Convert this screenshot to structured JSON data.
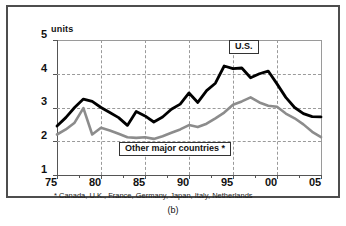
{
  "figure": {
    "caption": "(b)",
    "footnote": "* Canada, U.K., France, Germany, Japan, Italy, Netherlands",
    "units_label": "units"
  },
  "labels": {
    "us": "U.S.",
    "other": "Other major countries *"
  },
  "colors": {
    "us_line": "#000000",
    "other_line": "#8c8c8c",
    "grid": "#9a9a9a",
    "frame": "#4d4d4d",
    "text": "#111111"
  },
  "axes": {
    "y_ticks": [
      "5",
      "4",
      "3",
      "2",
      "1"
    ],
    "x_ticks": [
      "75",
      "80",
      "85",
      "90",
      "95",
      "00",
      "05"
    ]
  },
  "chart_data": {
    "type": "line",
    "title": "",
    "xlabel": "",
    "ylabel": "units",
    "xlim": [
      1975,
      2005
    ],
    "ylim": [
      1,
      5
    ],
    "grid": true,
    "legend": "inline-boxed-labels",
    "x": [
      1975,
      1976,
      1977,
      1978,
      1979,
      1980,
      1981,
      1982,
      1983,
      1984,
      1985,
      1986,
      1987,
      1988,
      1989,
      1990,
      1991,
      1992,
      1993,
      1994,
      1995,
      1996,
      1997,
      1998,
      1999,
      2000,
      2001,
      2002,
      2003,
      2004,
      2005
    ],
    "series": [
      {
        "name": "U.S.",
        "color": "#000000",
        "values": [
          2.45,
          2.7,
          3.0,
          3.25,
          3.18,
          3.0,
          2.85,
          2.7,
          2.47,
          2.88,
          2.75,
          2.57,
          2.72,
          2.95,
          3.1,
          3.43,
          3.15,
          3.5,
          3.72,
          4.23,
          4.15,
          4.17,
          3.88,
          4.0,
          4.08,
          3.7,
          3.3,
          3.0,
          2.82,
          2.73,
          2.72
        ]
      },
      {
        "name": "Other major countries *",
        "color": "#8c8c8c",
        "values": [
          2.2,
          2.35,
          2.55,
          2.98,
          2.2,
          2.4,
          2.32,
          2.22,
          2.12,
          2.1,
          2.12,
          2.07,
          2.15,
          2.25,
          2.35,
          2.48,
          2.42,
          2.52,
          2.68,
          2.85,
          3.08,
          3.18,
          3.3,
          3.15,
          3.05,
          3.02,
          2.82,
          2.68,
          2.5,
          2.28,
          2.12
        ]
      }
    ],
    "annotations": [
      {
        "text": "U.S.",
        "x": 1994.5,
        "y": 4.62
      },
      {
        "text": "Other major countries *",
        "x": 1987.5,
        "y": 1.72
      }
    ]
  }
}
